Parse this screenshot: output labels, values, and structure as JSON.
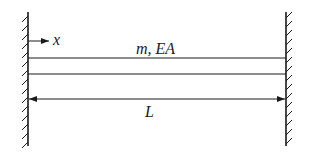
{
  "diagram": {
    "type": "fixed-fixed bar (axial vibration)",
    "labels": {
      "axis": "x",
      "properties": "m, EA",
      "length": "L"
    },
    "supports": [
      {
        "name": "left-fixed-support",
        "side": "left"
      },
      {
        "name": "right-fixed-support",
        "side": "right"
      }
    ],
    "colors": {
      "line": "#1a1a1a",
      "background": "#ffffff"
    }
  }
}
